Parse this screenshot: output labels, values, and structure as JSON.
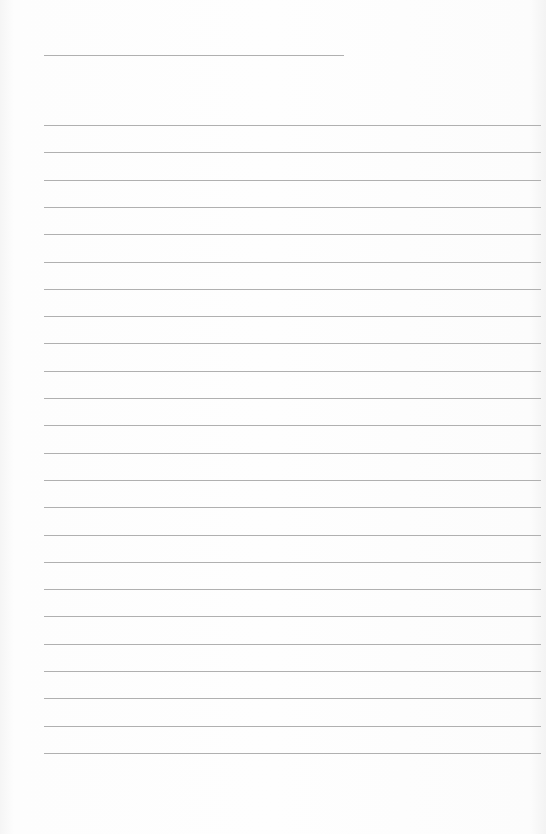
{
  "page": {
    "type": "lined-paper",
    "background_color": "#fdfdfd",
    "line_color": "#b0b0b0",
    "title_line": {
      "x": 44,
      "y": 55,
      "width": 300
    },
    "ruled_lines": {
      "count": 24,
      "x": 44,
      "width": 497,
      "first_y": 125,
      "spacing": 27.3
    }
  }
}
